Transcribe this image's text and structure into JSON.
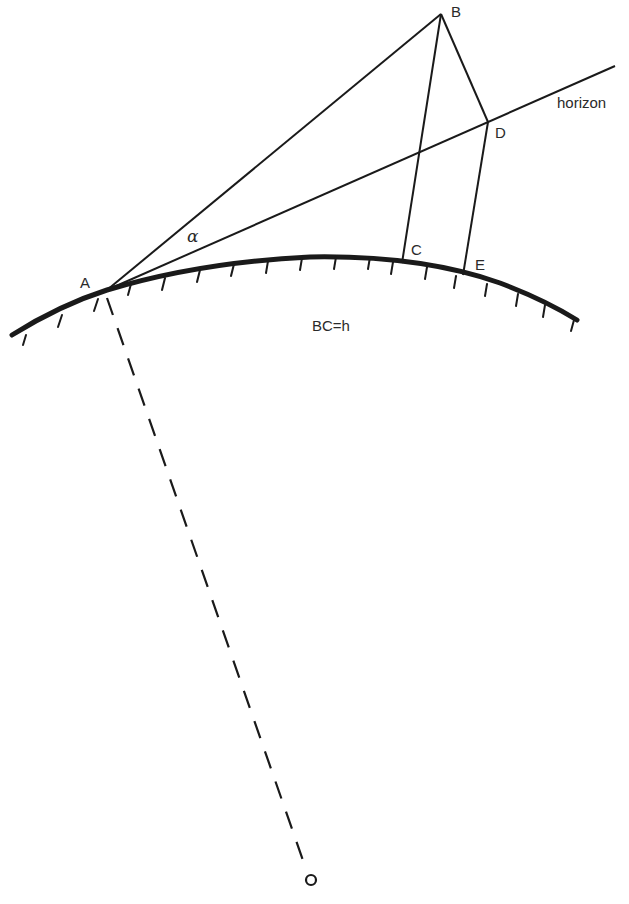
{
  "diagram": {
    "type": "geometry",
    "colors": {
      "stroke": "#1a1a1a",
      "background": "#ffffff"
    },
    "points": {
      "A": {
        "label": "A",
        "x": 107,
        "y": 290
      },
      "B": {
        "label": "B",
        "x": 441,
        "y": 14
      },
      "C": {
        "label": "C",
        "x": 402,
        "y": 263
      },
      "D": {
        "label": "D",
        "x": 488,
        "y": 122
      },
      "E": {
        "label": "E",
        "x": 463,
        "y": 275
      },
      "O": {
        "label": "",
        "x": 311,
        "y": 880
      }
    },
    "labels": {
      "A": "A",
      "B": "B",
      "C": "C",
      "D": "D",
      "E": "E",
      "horizon": "horizon",
      "alpha": "α",
      "equation": "BC=h"
    },
    "lines": [
      {
        "name": "line-AB",
        "from": "A",
        "to": "B",
        "style": "solid"
      },
      {
        "name": "line-horizon",
        "from": "A",
        "to": "horizon-end",
        "style": "solid"
      },
      {
        "name": "line-BC",
        "from": "B",
        "to": "C",
        "style": "solid"
      },
      {
        "name": "line-BD",
        "from": "B",
        "to": "D",
        "style": "solid"
      },
      {
        "name": "line-DE",
        "from": "D",
        "to": "E",
        "style": "solid"
      },
      {
        "name": "line-AO-radius",
        "from": "A",
        "to": "O",
        "style": "dashed"
      }
    ],
    "curve": {
      "name": "earth-surface-arc",
      "style": "thick with hatch marks below"
    }
  }
}
